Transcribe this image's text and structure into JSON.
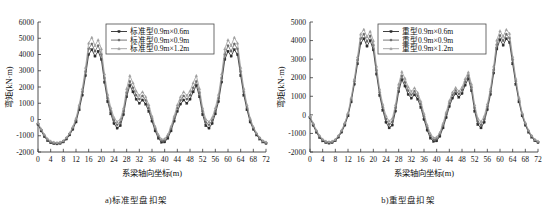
{
  "figure": {
    "background": "#ffffff",
    "axis_color": "#3a3a3a"
  },
  "chart_data": [
    {
      "type": "line",
      "panel_id": "a",
      "title": "",
      "caption": "a)标准型盘扣架",
      "xlabel": "系梁轴向坐标(m)",
      "ylabel": "弯矩(kN·m)",
      "xlim": [
        0,
        72
      ],
      "ylim": [
        -2000,
        6000
      ],
      "xticks": [
        0,
        4,
        8,
        12,
        16,
        20,
        24,
        28,
        32,
        36,
        40,
        44,
        48,
        52,
        56,
        60,
        64,
        68,
        72
      ],
      "yticks": [
        -2000,
        -1000,
        0,
        1000,
        2000,
        3000,
        4000,
        5000,
        6000
      ],
      "grid": false,
      "legend_position": "top-center",
      "x": [
        0,
        1,
        2,
        3,
        4,
        5,
        6,
        7,
        8,
        9,
        10,
        11,
        12,
        13,
        14,
        15,
        16,
        17,
        18,
        19,
        20,
        21,
        22,
        23,
        24,
        25,
        26,
        27,
        28,
        29,
        30,
        31,
        32,
        33,
        34,
        35,
        36,
        37,
        38,
        39,
        40,
        41,
        42,
        43,
        44,
        45,
        46,
        47,
        48,
        49,
        50,
        51,
        52,
        53,
        54,
        55,
        56,
        57,
        58,
        59,
        60,
        61,
        62,
        63,
        64,
        65,
        66,
        67,
        68,
        69,
        70,
        71,
        72
      ],
      "series": [
        {
          "name": "标准型0.9m×0.6m",
          "color": "#2b2b2b",
          "marker": "square",
          "values": [
            -300,
            -700,
            -1050,
            -1300,
            -1430,
            -1480,
            -1500,
            -1470,
            -1380,
            -1200,
            -950,
            -600,
            -150,
            600,
            1500,
            2700,
            4000,
            4300,
            3900,
            4200,
            3700,
            2300,
            1100,
            350,
            -250,
            -530,
            -380,
            300,
            1400,
            2100,
            1700,
            1250,
            1000,
            1200,
            950,
            500,
            -100,
            -700,
            -1150,
            -1400,
            -1380,
            -1150,
            -700,
            -100,
            500,
            950,
            1200,
            1000,
            1250,
            1700,
            2100,
            1400,
            300,
            -380,
            -530,
            -250,
            350,
            1100,
            2300,
            3700,
            4200,
            3900,
            4300,
            4000,
            2700,
            1500,
            600,
            -150,
            -600,
            -950,
            -1200,
            -1380,
            -1470,
            -1500,
            -1480,
            -1430,
            -1300,
            -1050,
            -700,
            -300
          ]
        },
        {
          "name": "标准型0.9m×0.9m",
          "color": "#6a6a6a",
          "marker": "circle",
          "values": [
            -250,
            -640,
            -980,
            -1240,
            -1380,
            -1440,
            -1460,
            -1430,
            -1340,
            -1150,
            -890,
            -520,
            -40,
            750,
            1700,
            2950,
            4350,
            4650,
            4200,
            4550,
            4000,
            2550,
            1300,
            520,
            -60,
            -330,
            -180,
            500,
            1650,
            2350,
            1950,
            1500,
            1250,
            1450,
            1180,
            700,
            50,
            -560,
            -1030,
            -1300,
            -1280,
            -1030,
            -560,
            50,
            700,
            1180,
            1450,
            1250,
            1500,
            1950,
            2350,
            1650,
            500,
            -180,
            -330,
            -60,
            520,
            1300,
            2550,
            4000,
            4550,
            4200,
            4650,
            4350,
            2950,
            1700,
            750,
            -40,
            -520,
            -890,
            -1150,
            -1340,
            -1430,
            -1460,
            -1440,
            -1380,
            -1240,
            -980,
            -640,
            -250
          ]
        },
        {
          "name": "标准型0.9m×1.2m",
          "color": "#9e9e9e",
          "marker": "triangle",
          "values": [
            -200,
            -580,
            -920,
            -1180,
            -1330,
            -1400,
            -1420,
            -1390,
            -1300,
            -1100,
            -830,
            -440,
            80,
            900,
            1900,
            3200,
            4700,
            5050,
            4550,
            4900,
            4350,
            2800,
            1550,
            720,
            120,
            -140,
            10,
            700,
            1900,
            2700,
            2250,
            1750,
            1480,
            1700,
            1400,
            900,
            200,
            -430,
            -920,
            -1210,
            -1190,
            -920,
            -430,
            200,
            900,
            1400,
            1700,
            1480,
            1750,
            2250,
            2700,
            1900,
            700,
            10,
            -140,
            120,
            720,
            1550,
            2800,
            4350,
            4900,
            4550,
            5050,
            4700,
            3200,
            1900,
            900,
            80,
            -440,
            -830,
            -1100,
            -1300,
            -1390,
            -1420,
            -1400,
            -1330,
            -1180,
            -920,
            -580,
            -200
          ]
        }
      ]
    },
    {
      "type": "line",
      "panel_id": "b",
      "title": "",
      "caption": "b)重型盘扣架",
      "xlabel": "系梁轴向坐标(m)",
      "ylabel": "弯矩(kN·m)",
      "xlim": [
        0,
        72
      ],
      "ylim": [
        -2000,
        5000
      ],
      "xticks": [
        0,
        4,
        8,
        12,
        16,
        20,
        24,
        28,
        32,
        36,
        40,
        44,
        48,
        52,
        56,
        60,
        64,
        68,
        72
      ],
      "yticks": [
        -2000,
        -1000,
        0,
        1000,
        2000,
        3000,
        4000,
        5000
      ],
      "grid": false,
      "legend_position": "top-center",
      "x": [
        0,
        1,
        2,
        3,
        4,
        5,
        6,
        7,
        8,
        9,
        10,
        11,
        12,
        13,
        14,
        15,
        16,
        17,
        18,
        19,
        20,
        21,
        22,
        23,
        24,
        25,
        26,
        27,
        28,
        29,
        30,
        31,
        32,
        33,
        34,
        35,
        36,
        37,
        38,
        39,
        40,
        41,
        42,
        43,
        44,
        45,
        46,
        47,
        48,
        49,
        50,
        51,
        52,
        53,
        54,
        55,
        56,
        57,
        58,
        59,
        60,
        61,
        62,
        63,
        64,
        65,
        66,
        67,
        68,
        69,
        70,
        71,
        72
      ],
      "series": [
        {
          "name": "重型0.9m×0.6m",
          "color": "#2b2b2b",
          "marker": "square",
          "values": [
            -150,
            -560,
            -930,
            -1220,
            -1400,
            -1490,
            -1520,
            -1490,
            -1390,
            -1200,
            -930,
            -550,
            -50,
            700,
            1650,
            2750,
            3850,
            4100,
            3700,
            4000,
            3500,
            2200,
            1050,
            250,
            -400,
            -700,
            -550,
            200,
            1250,
            1900,
            1550,
            1100,
            900,
            1080,
            850,
            400,
            -250,
            -820,
            -1250,
            -1430,
            -1400,
            -1150,
            -700,
            -150,
            450,
            900,
            1150,
            950,
            1150,
            1600,
            1950,
            1300,
            200,
            -520,
            -700,
            -400,
            280,
            1100,
            2250,
            3550,
            4050,
            3750,
            4100,
            3900,
            2750,
            1650,
            700,
            -50,
            -550,
            -930,
            -1200,
            -1390,
            -1490,
            -1520,
            -1490,
            -1400,
            -1220,
            -930,
            -560,
            -150
          ]
        },
        {
          "name": "重型0.9m×0.9m",
          "color": "#6a6a6a",
          "marker": "circle",
          "values": [
            -110,
            -500,
            -870,
            -1160,
            -1350,
            -1450,
            -1480,
            -1450,
            -1350,
            -1150,
            -870,
            -480,
            40,
            820,
            1800,
            2950,
            4100,
            4350,
            3950,
            4250,
            3750,
            2400,
            1200,
            400,
            -230,
            -520,
            -370,
            380,
            1450,
            2100,
            1750,
            1300,
            1080,
            1270,
            1030,
            570,
            -80,
            -680,
            -1120,
            -1330,
            -1300,
            -1050,
            -570,
            20,
            620,
            1070,
            1320,
            1120,
            1330,
            1780,
            2130,
            1480,
            370,
            -360,
            -540,
            -250,
            430,
            1250,
            2420,
            3780,
            4280,
            3990,
            4340,
            4130,
            2970,
            1810,
            830,
            40,
            -480,
            -870,
            -1150,
            -1350,
            -1450,
            -1480,
            -1450,
            -1350,
            -1160,
            -870,
            -500,
            -110
          ]
        },
        {
          "name": "重型0.9m×1.2m",
          "color": "#9e9e9e",
          "marker": "triangle",
          "values": [
            -70,
            -450,
            -820,
            -1110,
            -1310,
            -1420,
            -1450,
            -1420,
            -1320,
            -1110,
            -820,
            -420,
            110,
            920,
            1930,
            3120,
            4350,
            4600,
            4200,
            4500,
            4000,
            2620,
            1380,
            560,
            -60,
            -340,
            -190,
            550,
            1650,
            2320,
            1960,
            1500,
            1260,
            1450,
            1200,
            730,
            70,
            -540,
            -1000,
            -1230,
            -1200,
            -950,
            -460,
            140,
            760,
            1220,
            1470,
            1270,
            1480,
            1940,
            2300,
            1650,
            540,
            -190,
            -370,
            -80,
            590,
            1420,
            2620,
            4020,
            4520,
            4230,
            4590,
            4380,
            3140,
            1950,
            940,
            110,
            -420,
            -820,
            -1110,
            -1320,
            -1420,
            -1450,
            -1420,
            -1310,
            -1110,
            -820,
            -450,
            -70
          ]
        }
      ]
    }
  ]
}
